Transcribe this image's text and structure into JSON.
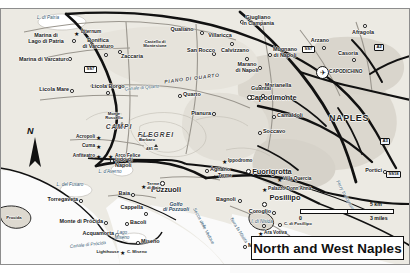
{
  "map": {
    "title": "North and West Naples",
    "north_indicator": "N",
    "scale": {
      "zero": "0",
      "km": "5 km",
      "miles": "3 miles"
    },
    "colors": {
      "land": "#e9e6df",
      "urban": "#d8d4cb",
      "water": "#ffffff",
      "road_major": "#1a1a1a",
      "road_minor": "#8a8a8a",
      "label": "#1a1a1a",
      "water_label": "#2b4a63",
      "site_marker": "#111111"
    },
    "cities": [
      {
        "name": "NAPLES",
        "x": 349,
        "y": 119
      }
    ],
    "major_towns": [
      {
        "name": "Capodimonte",
        "x": 273,
        "y": 98
      },
      {
        "name": "Fuorigrotta",
        "x": 272,
        "y": 172
      },
      {
        "name": "Posillipo",
        "x": 285,
        "y": 198
      },
      {
        "name": "Pozzuoli",
        "x": 166,
        "y": 190
      }
    ],
    "towns": [
      {
        "name": "Marina di\nLago di Patria",
        "x": 46,
        "y": 39
      },
      {
        "name": "Marina di Varcaturo",
        "x": 44,
        "y": 62
      },
      {
        "name": "Bonifica\ndi Varcaturo",
        "x": 95,
        "y": 44
      },
      {
        "name": "Zaccaria",
        "x": 128,
        "y": 57
      },
      {
        "name": "Qualiano",
        "x": 183,
        "y": 32
      },
      {
        "name": "Castello di\nMontesione",
        "x": 154,
        "y": 46
      },
      {
        "name": "San Rocco",
        "x": 197,
        "y": 52
      },
      {
        "name": "Giugliano\nin Campania",
        "x": 254,
        "y": 22
      },
      {
        "name": "Villaricca",
        "x": 222,
        "y": 37
      },
      {
        "name": "Calvizzano",
        "x": 237,
        "y": 50
      },
      {
        "name": "Mugnano\ndi Napoli",
        "x": 283,
        "y": 52
      },
      {
        "name": "Marano\ndi Napoli",
        "x": 248,
        "y": 66
      },
      {
        "name": "Arzano",
        "x": 320,
        "y": 40
      },
      {
        "name": "Afragola",
        "x": 360,
        "y": 30
      },
      {
        "name": "Casoria",
        "x": 350,
        "y": 52
      },
      {
        "name": "Marianella",
        "x": 272,
        "y": 85
      },
      {
        "name": "Quarto",
        "x": 190,
        "y": 94
      },
      {
        "name": "Guantai",
        "x": 254,
        "y": 88
      },
      {
        "name": "Pianura",
        "x": 200,
        "y": 113
      },
      {
        "name": "Camaldoli",
        "x": 282,
        "y": 115
      },
      {
        "name": "Soccavo",
        "x": 271,
        "y": 131
      },
      {
        "name": "Licola Mare",
        "x": 48,
        "y": 89
      },
      {
        "name": "Licola Borgo",
        "x": 100,
        "y": 86
      },
      {
        "name": "Lido di\nNapoli",
        "x": 122,
        "y": 161
      },
      {
        "name": "Agnano",
        "x": 216,
        "y": 169
      },
      {
        "name": "Bagnoli",
        "x": 222,
        "y": 200
      },
      {
        "name": "Coroglio",
        "x": 254,
        "y": 211
      },
      {
        "name": "Torregaveta",
        "x": 55,
        "y": 199
      },
      {
        "name": "Baia",
        "x": 134,
        "y": 196
      },
      {
        "name": "Cappella",
        "x": 137,
        "y": 209
      },
      {
        "name": "Bacoli",
        "x": 140,
        "y": 222
      },
      {
        "name": "Monte di Prócida",
        "x": 72,
        "y": 221
      },
      {
        "name": "Acquamorta",
        "x": 89,
        "y": 233
      },
      {
        "name": "Miseno",
        "x": 152,
        "y": 241
      },
      {
        "name": "Marechiaro",
        "x": 258,
        "y": 245
      },
      {
        "name": "Portici",
        "x": 373,
        "y": 174
      },
      {
        "name": "Procida",
        "x": 20,
        "y": 218
      }
    ],
    "sites": [
      {
        "name": "Liternum",
        "x": 86,
        "y": 33
      },
      {
        "name": "Acropoli",
        "x": 73,
        "y": 137
      },
      {
        "name": "Cuma",
        "x": 76,
        "y": 146
      },
      {
        "name": "Anfiteatro",
        "x": 68,
        "y": 156
      },
      {
        "name": "Arco Felice",
        "x": 118,
        "y": 156
      },
      {
        "name": "Ippodromo",
        "x": 232,
        "y": 161
      },
      {
        "name": "Terme",
        "x": 221,
        "y": 176
      },
      {
        "name": "Villa Quercia",
        "x": 310,
        "y": 179
      },
      {
        "name": "Palazzo Donn'Anna",
        "x": 312,
        "y": 190
      },
      {
        "name": "Ara Votiva",
        "x": 272,
        "y": 233
      },
      {
        "name": "Terme\ndi Baia",
        "x": 150,
        "y": 186
      },
      {
        "name": "Lighthouse",
        "x": 118,
        "y": 252
      },
      {
        "name": "C. Miseno",
        "x": 139,
        "y": 252
      },
      {
        "name": "C. di Posillipo",
        "x": 290,
        "y": 224
      }
    ],
    "peaks": [
      {
        "name": "Monte\nRuscello",
        "elev": "141 m",
        "x": 114,
        "y": 118
      },
      {
        "name": "Monte\nBarbaro",
        "elev": "481 m",
        "x": 147,
        "y": 140
      }
    ],
    "regions": [
      {
        "name": "CAMPI",
        "x": 119,
        "y": 128
      },
      {
        "name": "FLEGREI",
        "x": 152,
        "y": 136
      },
      {
        "name": "PIANO DI QUARTO",
        "x": 192,
        "y": 81
      }
    ],
    "water_labels": [
      {
        "name": "L. di Patria",
        "x": 48,
        "y": 18
      },
      {
        "name": "L. d'Averno",
        "x": 110,
        "y": 172
      },
      {
        "name": "L. del Fusaro",
        "x": 70,
        "y": 185
      },
      {
        "name": "Lago\nMiseno",
        "x": 122,
        "y": 235
      },
      {
        "name": "Golfo\ndi Pozzuoli",
        "x": 176,
        "y": 208
      },
      {
        "name": "I. di Nisida",
        "x": 262,
        "y": 222
      },
      {
        "name": "Canale di Quarto",
        "x": 142,
        "y": 88
      },
      {
        "name": "Canale di Prócida",
        "x": 88,
        "y": 245
      },
      {
        "name": "Secca delle Vedove",
        "x": 203,
        "y": 226
      },
      {
        "name": "Terra la Nisida",
        "x": 238,
        "y": 230
      },
      {
        "name": "Ferry to Sorrento",
        "x": 345,
        "y": 196
      }
    ],
    "road_shields": [
      {
        "label": "SS7",
        "x": 88,
        "y": 69
      },
      {
        "label": "SS7",
        "x": 308,
        "y": 48
      },
      {
        "label": "A2",
        "x": 378,
        "y": 46
      },
      {
        "label": "A3",
        "x": 384,
        "y": 140
      },
      {
        "label": "SS18",
        "x": 392,
        "y": 173
      }
    ],
    "airport": {
      "name": "CAPODICHINO",
      "icon": "airplane-icon",
      "x": 332,
      "y": 72
    }
  }
}
